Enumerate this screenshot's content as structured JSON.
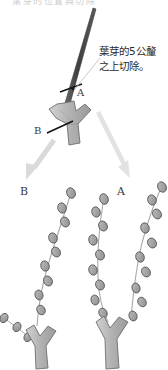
{
  "diagram": {
    "title_fragment_clipped": "葉芽的位置與切除",
    "annotation": {
      "line1": "葉芽的5公釐",
      "line2": "之上切除。",
      "full_text": "葉芽的5公釐之上切除。"
    },
    "labels": {
      "cut_a_upper": "A",
      "cut_b_upper": "B",
      "result_b": "B",
      "result_a": "A"
    },
    "colors": {
      "stem_dark": "#4a4a4a",
      "stem_fill": "#b8b8b8",
      "stem_stroke": "#6e6e6e",
      "bud_fill": "#9c9c9c",
      "bud_stroke": "#555555",
      "cut_mark": "#1a1a1a",
      "arrow": "#d9d9d9",
      "leader_line": "#c2c2c2",
      "text": "#2b2b2b",
      "background": "#ffffff"
    },
    "parts": {
      "main_stem": "main-stem-cane",
      "fork": "y-shaped-fork",
      "cut_mark_a": "cut-mark-a",
      "cut_mark_b": "cut-mark-b",
      "bud_dot": "leaf-bud-dot",
      "leader": "annotation-leader-line",
      "arrow_left": "arrow-to-result-b",
      "arrow_right": "arrow-to-result-a",
      "result_shoot_left": "resulting-shoot-b",
      "result_shoot_middle": "resulting-shoot-middle",
      "result_shoot_right": "resulting-shoot-a",
      "base_fork_left": "base-fork-left",
      "base_fork_right": "base-fork-right"
    }
  }
}
